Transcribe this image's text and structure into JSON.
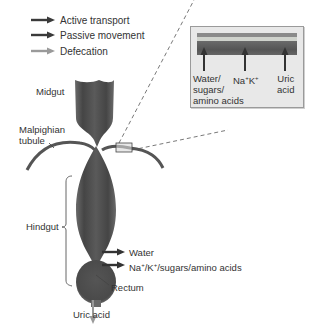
{
  "legend": {
    "items": [
      {
        "label": "Active transport",
        "color": "#3a3a3a",
        "arrow": "active-transport-arrow"
      },
      {
        "label": "Passive movement",
        "color": "#3a3a3a",
        "arrow": "passive-movement-arrow"
      },
      {
        "label": "Defecation",
        "color": "#9a9a9a",
        "arrow": "defecation-arrow"
      }
    ]
  },
  "labels": {
    "midgut": "Midgut",
    "malpighian_line1": "Malpighian",
    "malpighian_line2": "tubule",
    "hindgut": "Hindgut",
    "rectum": "Rectum",
    "uric_acid": "Uric acid",
    "water": "Water",
    "ions_prefix": "Na",
    "ions_sup1": "+",
    "ions_mid": "/K",
    "ions_sup2": "+",
    "ions_suffix": "/sugars/amino acids"
  },
  "inset": {
    "col1_line1": "Water/",
    "col1_line2": "sugars/",
    "col1_line3": "amino acids",
    "col2_prefix": "Na",
    "col2_sup1": "+",
    "col2_mid": "K",
    "col2_sup2": "+",
    "col3_line1": "Uric",
    "col3_line2": "acid"
  },
  "colors": {
    "gut": "#4a4a4a",
    "gut_highlight": "#7a7a7a",
    "arrow_dark": "#333333",
    "arrow_light": "#9a9a9a",
    "inset_bg": "#e8e8e8"
  }
}
